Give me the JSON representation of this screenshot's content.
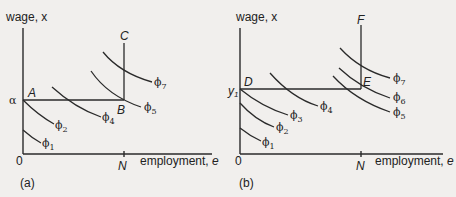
{
  "panels": [
    {
      "id": "a",
      "caption": "(a)",
      "y_axis_label": "wage, x",
      "x_axis_label": "employment, e",
      "origin_label": "0",
      "x_tick_label": "N",
      "y_tick_label": "α",
      "points": {
        "A": "A",
        "B": "B",
        "C": "C"
      },
      "curves": [
        {
          "symbol": "ϕ",
          "index": "1"
        },
        {
          "symbol": "ϕ",
          "index": "2"
        },
        {
          "symbol": "ϕ",
          "index": "4"
        },
        {
          "symbol": "ϕ",
          "index": "5"
        },
        {
          "symbol": "ϕ",
          "index": "7"
        }
      ]
    },
    {
      "id": "b",
      "caption": "(b)",
      "y_axis_label": "wage, x",
      "x_axis_label": "employment, e",
      "origin_label": "0",
      "x_tick_label": "N",
      "y_tick_label": "y",
      "y_tick_sub": "1",
      "points": {
        "D": "D",
        "E": "E",
        "F": "F"
      },
      "curves": [
        {
          "symbol": "ϕ",
          "index": "1"
        },
        {
          "symbol": "ϕ",
          "index": "2"
        },
        {
          "symbol": "ϕ",
          "index": "3"
        },
        {
          "symbol": "ϕ",
          "index": "4"
        },
        {
          "symbol": "ϕ",
          "index": "5"
        },
        {
          "symbol": "ϕ",
          "index": "6"
        },
        {
          "symbol": "ϕ",
          "index": "7"
        }
      ]
    }
  ]
}
